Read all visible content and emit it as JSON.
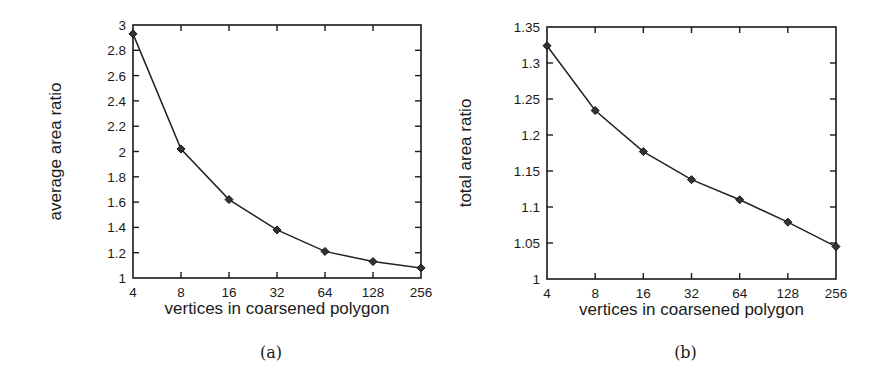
{
  "chart_data": [
    {
      "id": "a",
      "type": "line",
      "title": "",
      "caption": "(a)",
      "xlabel": "vertices in coarsened polygon",
      "ylabel": "average area ratio",
      "x_scale": "log2",
      "x": [
        4,
        8,
        16,
        32,
        64,
        128,
        256
      ],
      "x_tick_labels": [
        "4",
        "8",
        "16",
        "32",
        "64",
        "128",
        "256"
      ],
      "series": [
        {
          "name": "average area ratio",
          "marker": "diamond",
          "values": [
            2.93,
            2.02,
            1.62,
            1.38,
            1.21,
            1.13,
            1.08
          ]
        }
      ],
      "ylim": [
        1,
        3
      ],
      "y_ticks": [
        1,
        1.2,
        1.4,
        1.6,
        1.8,
        2,
        2.2,
        2.4,
        2.6,
        2.8,
        3
      ],
      "y_tick_labels": [
        "1",
        "1.2",
        "1.4",
        "1.6",
        "1.8",
        "2",
        "2.2",
        "2.4",
        "2.6",
        "2.8",
        "3"
      ],
      "grid": false,
      "legend": "none"
    },
    {
      "id": "b",
      "type": "line",
      "title": "",
      "caption": "(b)",
      "xlabel": "vertices in coarsened polygon",
      "ylabel": "total area ratio",
      "x_scale": "log2",
      "x": [
        4,
        8,
        16,
        32,
        64,
        128,
        256
      ],
      "x_tick_labels": [
        "4",
        "8",
        "16",
        "32",
        "64",
        "128",
        "256"
      ],
      "series": [
        {
          "name": "total area ratio",
          "marker": "diamond",
          "values": [
            1.324,
            1.234,
            1.177,
            1.138,
            1.11,
            1.079,
            1.045
          ]
        }
      ],
      "ylim": [
        1,
        1.35
      ],
      "y_ticks": [
        1,
        1.05,
        1.1,
        1.15,
        1.2,
        1.25,
        1.3,
        1.35
      ],
      "y_tick_labels": [
        "1",
        "1.05",
        "1.1",
        "1.15",
        "1.2",
        "1.25",
        "1.3",
        "1.35"
      ],
      "grid": false,
      "legend": "none"
    }
  ],
  "layout": {
    "panels": [
      {
        "frame": {
          "left": 133,
          "top": 25,
          "right": 421,
          "bottom": 278
        },
        "ylabel_x": 57,
        "caption_y": 358
      },
      {
        "frame": {
          "left": 547,
          "top": 27,
          "right": 836,
          "bottom": 279
        },
        "ylabel_x": 467,
        "caption_y": 358
      }
    ]
  }
}
